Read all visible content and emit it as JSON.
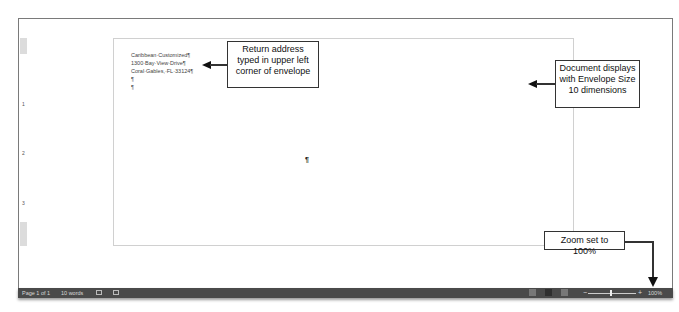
{
  "document": {
    "return_address": [
      "Caribbean·Customized¶",
      "1300·Bay·View·Drive¶",
      "Coral·Gables,·FL·33124¶",
      "¶",
      "¶"
    ],
    "center_paragraph_mark": "¶"
  },
  "ruler": {
    "numbers": [
      "1",
      "2",
      "3"
    ]
  },
  "callouts": {
    "return_address": "Return address typed in upper left corner of envelope",
    "envelope_size": "Document displays with Envelope Size 10 dimensions",
    "zoom": "Zoom set to 100%"
  },
  "statusbar": {
    "page": "Page 1 of 1",
    "words": "10 words",
    "zoom_minus": "−",
    "zoom_plus": "+",
    "zoom_level": "100%"
  }
}
